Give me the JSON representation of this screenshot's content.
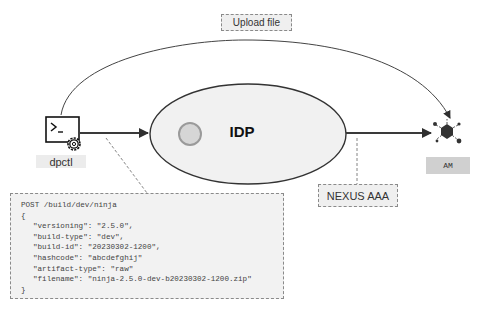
{
  "diagram": {
    "nodes": {
      "client": {
        "label": "dpctl",
        "icon": "terminal-gear-icon"
      },
      "idp": {
        "label": "IDP"
      },
      "am": {
        "label": "AM",
        "icon": "network-hub-icon"
      }
    },
    "annotations": {
      "upload": "Upload file",
      "nexus": "NEXUS AAA"
    },
    "request": {
      "lines": [
        "POST /build/dev/ninja",
        "{",
        "\"versioning\": \"2.5.0\",",
        "\"build-type\": \"dev\",",
        "\"build-id\": \"20230302-1200\",",
        "\"hashcode\": \"abcdefghij\"",
        "\"artifact-type\": \"raw\"",
        "\"filename\": \"ninja-2.5.0-dev-b20230302-1200.zip\"",
        "}"
      ]
    },
    "edges": [
      {
        "from": "dpctl",
        "to": "AM",
        "label": "Upload file",
        "style": "curved"
      },
      {
        "from": "dpctl",
        "to": "IDP",
        "style": "straight"
      },
      {
        "from": "IDP",
        "to": "AM",
        "style": "straight"
      }
    ],
    "colors": {
      "line": "#3a3a3a",
      "ellipse_fill": "#efefef",
      "note_fill": "#efefef",
      "inner_circle_fill": "#d6d6d6",
      "inner_circle_stroke": "#9a9a9a",
      "am_label_fill": "#d0d0d0"
    }
  }
}
